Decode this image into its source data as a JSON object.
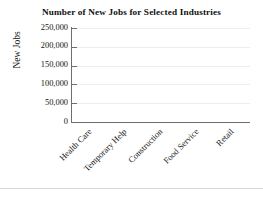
{
  "chart_data": {
    "type": "bar",
    "title": "Number of New Jobs for Selected Industries",
    "xlabel": "",
    "ylabel": "New Jobs",
    "categories": [
      "Health Care",
      "Temporary Help",
      "Construction",
      "Food Service",
      "Retail"
    ],
    "values": [
      null,
      null,
      null,
      null,
      null
    ],
    "series": [
      {
        "name": "New Jobs",
        "values": [
          null,
          null,
          null,
          null,
          null
        ]
      }
    ],
    "ylim": [
      0,
      250000
    ],
    "ytick_values": [
      0,
      50000,
      100000,
      150000,
      200000,
      250000
    ],
    "ytick_labels": [
      "0",
      "50,000",
      "100,000",
      "150,000",
      "200,000",
      "250,000"
    ],
    "grid": true,
    "grid_axis": "y",
    "legend": false,
    "legend_position": "none",
    "xtick_label_rotation": 45,
    "note": "plot area rendered empty - no bars drawn",
    "colors": {
      "axis": "#6e6e6e",
      "grid": "#ededed",
      "text": "#151515",
      "background": "#ffffff"
    }
  }
}
